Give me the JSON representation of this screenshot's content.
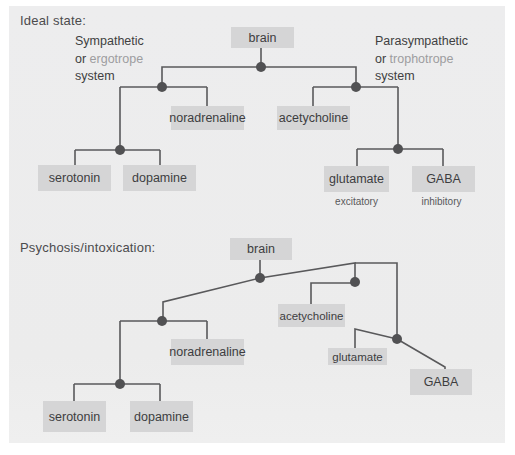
{
  "colors": {
    "panel_bg": "#ececec",
    "box_bg": "#d5d5d6",
    "line": "#59595b",
    "text": "#3d3d3f",
    "muted_term": "#9d9da0"
  },
  "ideal": {
    "heading": "Ideal state:",
    "left_system": {
      "line1": "Sympathetic",
      "line2_prefix": "or ",
      "line2_term": "ergotrope",
      "line3": "system"
    },
    "right_system": {
      "line1": "Parasympathetic",
      "line2_prefix": "or ",
      "line2_term": "trophotrope",
      "line3": "system"
    },
    "nodes": {
      "brain": "brain",
      "noradrenaline": "noradrenaline",
      "acetycholine": "acetycholine",
      "serotonin": "serotonin",
      "dopamine": "dopamine",
      "glutamate": "glutamate",
      "gaba": "GABA"
    },
    "glutamate_note": "excitatory",
    "gaba_note": "inhibitory"
  },
  "psychosis": {
    "heading": "Psychosis/intoxication:",
    "nodes": {
      "brain": "brain",
      "noradrenaline": "noradrenaline",
      "acetycholine": "acetycholine",
      "serotonin": "serotonin",
      "dopamine": "dopamine",
      "glutamate": "glutamate",
      "gaba": "GABA"
    }
  }
}
